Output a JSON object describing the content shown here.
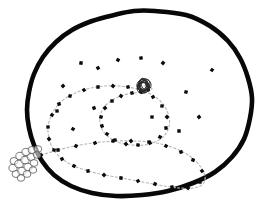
{
  "diagram": {
    "type": "line",
    "canvas": {
      "width": 266,
      "height": 214
    },
    "background_color": "#ffffff",
    "boundary": {
      "name": "outer-boundary",
      "description": "Thick irregular hand-drawn closed outline enclosing the spiral",
      "stroke_color": "#080808",
      "stroke_width": 4.6,
      "fill_color": "#ffffff",
      "points": [
        [
          155,
          11
        ],
        [
          186,
          15
        ],
        [
          210,
          26
        ],
        [
          228,
          41
        ],
        [
          240,
          58
        ],
        [
          248,
          78
        ],
        [
          252,
          98
        ],
        [
          250,
          118
        ],
        [
          244,
          139
        ],
        [
          232,
          157
        ],
        [
          215,
          172
        ],
        [
          193,
          183
        ],
        [
          168,
          191
        ],
        [
          142,
          195
        ],
        [
          116,
          196
        ],
        [
          92,
          193
        ],
        [
          71,
          186
        ],
        [
          54,
          175
        ],
        [
          42,
          161
        ],
        [
          34,
          145
        ],
        [
          29,
          128
        ],
        [
          27,
          110
        ],
        [
          29,
          92
        ],
        [
          34,
          74
        ],
        [
          43,
          57
        ],
        [
          56,
          42
        ],
        [
          72,
          30
        ],
        [
          92,
          21
        ],
        [
          114,
          15
        ],
        [
          134,
          11
        ]
      ]
    },
    "spiral": {
      "name": "spiral-route",
      "description": "Dotted spiral path running from the outer bubble cluster inward to the central scribble ball",
      "stroke_color": "#b9b9b9",
      "stroke_width": 1.15,
      "dash_pattern": "2.1 2.4",
      "turns": 2.75,
      "center": [
        144,
        86
      ],
      "start": [
        41,
        155
      ],
      "end": [
        144,
        86
      ],
      "points": [
        [
          41,
          155
        ],
        [
          55,
          151
        ],
        [
          70,
          147
        ],
        [
          86,
          144
        ],
        [
          102,
          142
        ],
        [
          118,
          141
        ],
        [
          134,
          141
        ],
        [
          150,
          142
        ],
        [
          165,
          145
        ],
        [
          179,
          150
        ],
        [
          191,
          157
        ],
        [
          200,
          166
        ],
        [
          205,
          176
        ],
        [
          203,
          184
        ],
        [
          194,
          188
        ],
        [
          180,
          188
        ],
        [
          164,
          186
        ],
        [
          148,
          183
        ],
        [
          132,
          180
        ],
        [
          116,
          177
        ],
        [
          100,
          174
        ],
        [
          85,
          170
        ],
        [
          72,
          165
        ],
        [
          61,
          158
        ],
        [
          53,
          149
        ],
        [
          49,
          138
        ],
        [
          48,
          127
        ],
        [
          51,
          116
        ],
        [
          57,
          106
        ],
        [
          66,
          98
        ],
        [
          78,
          92
        ],
        [
          91,
          88
        ],
        [
          105,
          86
        ],
        [
          119,
          86
        ],
        [
          133,
          88
        ],
        [
          146,
          92
        ],
        [
          157,
          98
        ],
        [
          165,
          107
        ],
        [
          169,
          117
        ],
        [
          169,
          127
        ],
        [
          164,
          136
        ],
        [
          155,
          142
        ],
        [
          144,
          145
        ],
        [
          132,
          145
        ],
        [
          120,
          143
        ],
        [
          110,
          138
        ],
        [
          103,
          131
        ],
        [
          100,
          122
        ],
        [
          101,
          113
        ],
        [
          106,
          105
        ],
        [
          114,
          99
        ],
        [
          124,
          95
        ],
        [
          134,
          93
        ],
        [
          143,
          92
        ],
        [
          149,
          91
        ],
        [
          152,
          89
        ],
        [
          150,
          87
        ],
        [
          146,
          86
        ],
        [
          144,
          86
        ]
      ]
    },
    "waypoints": {
      "name": "waypoint-markers",
      "description": "Small black square markers placed along the spiral route",
      "color": "#0b0b0b",
      "count": 64,
      "size": 3.4,
      "positions": [
        [
          41,
          155
        ],
        [
          58,
          150
        ],
        [
          76,
          146
        ],
        [
          95,
          143
        ],
        [
          113,
          141
        ],
        [
          131,
          141
        ],
        [
          149,
          142
        ],
        [
          166,
          146
        ],
        [
          181,
          152
        ],
        [
          193,
          160
        ],
        [
          202,
          171
        ],
        [
          200,
          182
        ],
        [
          188,
          188
        ],
        [
          172,
          187
        ],
        [
          155,
          184
        ],
        [
          138,
          181
        ],
        [
          121,
          178
        ],
        [
          104,
          175
        ],
        [
          88,
          171
        ],
        [
          74,
          166
        ],
        [
          62,
          159
        ],
        [
          54,
          150
        ],
        [
          49,
          139
        ],
        [
          48,
          127
        ],
        [
          52,
          115
        ],
        [
          59,
          104
        ],
        [
          70,
          96
        ],
        [
          84,
          90
        ],
        [
          98,
          87
        ],
        [
          113,
          86
        ],
        [
          128,
          87
        ],
        [
          141,
          91
        ],
        [
          153,
          97
        ],
        [
          162,
          106
        ],
        [
          167,
          117
        ],
        [
          166,
          128
        ],
        [
          160,
          137
        ],
        [
          150,
          143
        ],
        [
          138,
          145
        ],
        [
          126,
          144
        ],
        [
          115,
          140
        ],
        [
          107,
          134
        ],
        [
          102,
          126
        ],
        [
          101,
          117
        ],
        [
          105,
          108
        ],
        [
          112,
          101
        ],
        [
          121,
          96
        ],
        [
          132,
          93
        ],
        [
          141,
          92
        ],
        [
          148,
          90
        ],
        [
          152,
          117
        ],
        [
          163,
          63
        ],
        [
          141,
          58
        ],
        [
          118,
          60
        ],
        [
          98,
          68
        ],
        [
          81,
          63
        ],
        [
          63,
          86
        ],
        [
          57,
          111
        ],
        [
          73,
          129
        ],
        [
          94,
          108
        ],
        [
          186,
          92
        ],
        [
          199,
          117
        ],
        [
          179,
          131
        ],
        [
          212,
          70
        ]
      ]
    },
    "center_node": {
      "name": "central-scribble-ball",
      "description": "Tangled scribbled knot at the spiral's centre",
      "position": [
        144,
        86
      ],
      "radius": 8,
      "stroke_color": "#2a2a2a"
    },
    "terminal_cluster": {
      "name": "bubble-cluster",
      "description": "Cluster of small overlapping circles at the lower-left outside the boundary, marking the spiral's outer terminus",
      "position": [
        27,
        163
      ],
      "bubble_count": 17,
      "stroke_color": "#5a5a5a",
      "bubbles": [
        [
          14,
          161,
          4.0
        ],
        [
          20,
          156,
          4.2
        ],
        [
          26,
          152,
          4.1
        ],
        [
          32,
          150,
          4.0
        ],
        [
          38,
          149,
          3.8
        ],
        [
          13,
          168,
          4.1
        ],
        [
          19,
          164,
          4.3
        ],
        [
          25,
          160,
          4.2
        ],
        [
          31,
          157,
          4.0
        ],
        [
          37,
          155,
          3.7
        ],
        [
          16,
          174,
          4.0
        ],
        [
          22,
          171,
          4.2
        ],
        [
          28,
          167,
          4.1
        ],
        [
          34,
          163,
          3.9
        ],
        [
          21,
          178,
          3.8
        ],
        [
          27,
          174,
          3.9
        ],
        [
          33,
          170,
          3.7
        ]
      ]
    }
  },
  "chart_data": {
    "type": "line",
    "xlabel": "",
    "ylabel": "",
    "xlim": [
      0,
      266
    ],
    "ylim": [
      0,
      214
    ],
    "grid": false,
    "legend": "none",
    "series": [
      {
        "name": "outer-boundary",
        "kind": "closed-outline",
        "color": "#080808",
        "values": [
          [
            155,
            11
          ],
          [
            186,
            15
          ],
          [
            210,
            26
          ],
          [
            228,
            41
          ],
          [
            240,
            58
          ],
          [
            248,
            78
          ],
          [
            252,
            98
          ],
          [
            250,
            118
          ],
          [
            244,
            139
          ],
          [
            232,
            157
          ],
          [
            215,
            172
          ],
          [
            193,
            183
          ],
          [
            168,
            191
          ],
          [
            142,
            195
          ],
          [
            116,
            196
          ],
          [
            92,
            193
          ],
          [
            71,
            186
          ],
          [
            54,
            175
          ],
          [
            42,
            161
          ],
          [
            34,
            145
          ],
          [
            29,
            128
          ],
          [
            27,
            110
          ],
          [
            29,
            92
          ],
          [
            34,
            74
          ],
          [
            43,
            57
          ],
          [
            56,
            42
          ],
          [
            72,
            30
          ],
          [
            92,
            21
          ],
          [
            114,
            15
          ],
          [
            134,
            11
          ]
        ]
      },
      {
        "name": "spiral-route",
        "kind": "dotted-spiral",
        "color": "#b9b9b9",
        "turns": 2.75,
        "values": [
          [
            41,
            155
          ],
          [
            58,
            150
          ],
          [
            76,
            146
          ],
          [
            95,
            143
          ],
          [
            113,
            141
          ],
          [
            131,
            141
          ],
          [
            149,
            142
          ],
          [
            166,
            146
          ],
          [
            181,
            152
          ],
          [
            193,
            160
          ],
          [
            202,
            171
          ],
          [
            200,
            182
          ],
          [
            188,
            188
          ],
          [
            172,
            187
          ],
          [
            155,
            184
          ],
          [
            138,
            181
          ],
          [
            121,
            178
          ],
          [
            104,
            175
          ],
          [
            88,
            171
          ],
          [
            74,
            166
          ],
          [
            62,
            159
          ],
          [
            54,
            150
          ],
          [
            49,
            139
          ],
          [
            48,
            127
          ],
          [
            52,
            115
          ],
          [
            59,
            104
          ],
          [
            70,
            96
          ],
          [
            84,
            90
          ],
          [
            98,
            87
          ],
          [
            113,
            86
          ],
          [
            128,
            87
          ],
          [
            141,
            91
          ],
          [
            153,
            97
          ],
          [
            162,
            106
          ],
          [
            167,
            117
          ],
          [
            166,
            128
          ],
          [
            160,
            137
          ],
          [
            150,
            143
          ],
          [
            138,
            145
          ],
          [
            126,
            144
          ],
          [
            115,
            140
          ],
          [
            107,
            134
          ],
          [
            102,
            126
          ],
          [
            101,
            117
          ],
          [
            105,
            108
          ],
          [
            112,
            101
          ],
          [
            121,
            96
          ],
          [
            132,
            93
          ],
          [
            141,
            92
          ],
          [
            144,
            86
          ]
        ]
      }
    ],
    "annotations": [
      {
        "name": "central-scribble-ball",
        "x": 144,
        "y": 86,
        "label": ""
      },
      {
        "name": "bubble-cluster",
        "x": 27,
        "y": 163,
        "label": ""
      }
    ]
  }
}
